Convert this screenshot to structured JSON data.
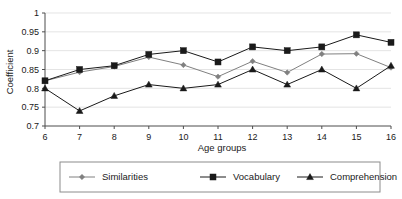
{
  "chart_data": {
    "type": "line",
    "title": "",
    "xlabel": "Age groups",
    "ylabel": "Coefficient",
    "categories": [
      "6",
      "7",
      "8",
      "9",
      "10",
      "11",
      "12",
      "13",
      "14",
      "15",
      "16"
    ],
    "x": [
      6,
      7,
      8,
      9,
      10,
      11,
      12,
      13,
      14,
      15,
      16
    ],
    "xlim": [
      6,
      16
    ],
    "ylim": [
      0.7,
      1
    ],
    "yticks": [
      "0.7",
      "0.75",
      "0.8",
      "0.85",
      "0.9",
      "0.95",
      "1"
    ],
    "ytick_values": [
      0.7,
      0.75,
      0.8,
      0.85,
      0.9,
      0.95,
      1
    ],
    "grid": "horizontal",
    "legend_position": "bottom",
    "series": [
      {
        "name": "Similarities",
        "marker": "diamond",
        "color": "#808080",
        "values": [
          0.82,
          0.843,
          0.858,
          0.883,
          0.862,
          0.831,
          0.872,
          0.842,
          0.891,
          0.892,
          0.855
        ]
      },
      {
        "name": "Vocabulary",
        "marker": "square",
        "color": "#1a1a1a",
        "values": [
          0.82,
          0.85,
          0.86,
          0.89,
          0.9,
          0.87,
          0.91,
          0.9,
          0.91,
          0.942,
          0.922
        ]
      },
      {
        "name": "Comprehension",
        "marker": "triangle",
        "color": "#1a1a1a",
        "values": [
          0.8,
          0.74,
          0.78,
          0.81,
          0.8,
          0.81,
          0.85,
          0.81,
          0.85,
          0.8,
          0.86
        ]
      }
    ]
  },
  "legend": {
    "entries": [
      {
        "label": "Similarities"
      },
      {
        "label": "Vocabulary"
      },
      {
        "label": "Comprehension"
      }
    ]
  },
  "axes": {
    "y_title": "Coefficient",
    "x_title": "Age groups"
  }
}
